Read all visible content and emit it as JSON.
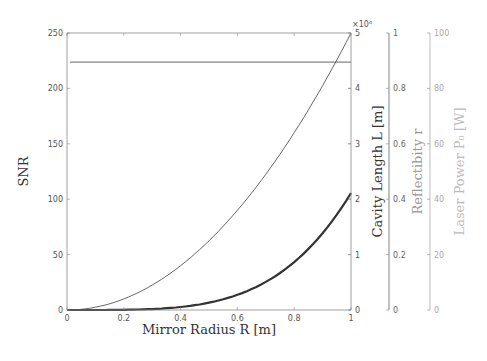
{
  "chart_data": {
    "type": "line",
    "title": "",
    "xlabel": "Mirror Radius  R [m]",
    "xlim": [
      0,
      1
    ],
    "xticks": [
      0,
      0.2,
      0.4,
      0.6,
      0.8,
      1
    ],
    "xtick_labels": [
      "0",
      "0.2",
      "0.4",
      "0.6",
      "0.8",
      "1"
    ],
    "grid": false,
    "legend": null,
    "y_axes": [
      {
        "id": "snr",
        "label": "SNR",
        "side": "left",
        "ylim": [
          0,
          250
        ],
        "ticks": [
          0,
          50,
          100,
          150,
          200,
          250
        ],
        "tick_labels": [
          "0",
          "50",
          "100",
          "150",
          "200",
          "250"
        ],
        "color": "#333333"
      },
      {
        "id": "cavity_length",
        "label": "Cavity Length  L [m]",
        "side": "right",
        "ylim": [
          0,
          5000000
        ],
        "ticks": [
          0,
          1,
          2,
          3,
          4,
          5
        ],
        "tick_labels": [
          "0",
          "1",
          "2",
          "3",
          "4",
          "5"
        ],
        "multiplier": "×10⁶",
        "color": "#333333"
      },
      {
        "id": "reflectivity",
        "label": "Reflectibity  r",
        "side": "right",
        "ylim": [
          0,
          1
        ],
        "ticks": [
          0,
          0.2,
          0.4,
          0.6,
          0.8,
          1
        ],
        "tick_labels": [
          "0",
          "0.2",
          "0.4",
          "0.6",
          "0.8",
          "1"
        ],
        "color": "#666666"
      },
      {
        "id": "laser_power",
        "label": "Laser Power  P₀ [W]",
        "side": "right",
        "ylim": [
          0,
          100
        ],
        "ticks": [
          0,
          20,
          40,
          60,
          80,
          100
        ],
        "tick_labels": [
          "0",
          "20",
          "40",
          "60",
          "80",
          "100"
        ],
        "color": "#aaaaaa"
      }
    ],
    "series": [
      {
        "name": "Reflectivity r (constant)",
        "axis": "reflectivity",
        "style": "thin",
        "x": [
          0,
          0.2,
          0.4,
          0.6,
          0.8,
          1.0
        ],
        "values": [
          0.895,
          0.895,
          0.895,
          0.895,
          0.895,
          0.895
        ]
      },
      {
        "name": "Cavity Length L",
        "axis": "cavity_length",
        "style": "thin",
        "x": [
          0,
          0.1,
          0.2,
          0.3,
          0.4,
          0.5,
          0.6,
          0.7,
          0.8,
          0.9,
          1.0
        ],
        "values": [
          0,
          50000,
          200000,
          450000,
          800000,
          1250000,
          1800000,
          2450000,
          3200000,
          4050000,
          5000000
        ]
      },
      {
        "name": "SNR",
        "axis": "snr",
        "style": "thick",
        "x": [
          0,
          0.1,
          0.2,
          0.3,
          0.4,
          0.5,
          0.6,
          0.7,
          0.8,
          0.9,
          1.0
        ],
        "values": [
          0,
          0.01,
          0.17,
          0.86,
          2.7,
          6.6,
          13.7,
          25.4,
          43.3,
          69.3,
          105.6
        ]
      }
    ]
  }
}
